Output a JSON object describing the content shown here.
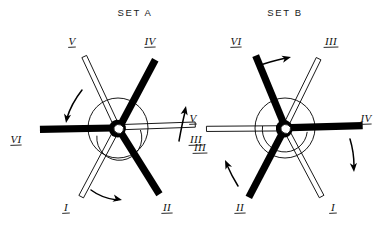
{
  "figure": {
    "caption": "",
    "sets": [
      {
        "id": "set-a",
        "title": "SET A",
        "title_x": 135,
        "title_y": 16,
        "center_x": 118,
        "center_y": 128,
        "hub_radius": 30,
        "spokes": [
          {
            "label": "V",
            "style": "hollow",
            "angle_deg": 115,
            "length": 78,
            "label_x": 72,
            "label_y": 45,
            "underline": true
          },
          {
            "label": "IV",
            "style": "solid",
            "angle_deg": 62,
            "length": 78,
            "label_x": 150,
            "label_y": 45,
            "underline": true
          },
          {
            "label": "III",
            "style": "hollow",
            "angle_deg": 2,
            "length": 78,
            "label_x": 200,
            "label_y": 151,
            "underline": true
          },
          {
            "label": "II",
            "style": "solid",
            "angle_deg": -58,
            "length": 78,
            "label_x": 167,
            "label_y": 211,
            "underline": true
          },
          {
            "label": "I",
            "style": "hollow",
            "angle_deg": -118,
            "length": 78,
            "label_x": 66,
            "label_y": 211,
            "underline": true
          },
          {
            "label": "VI",
            "style": "solid",
            "angle_deg": 181,
            "length": 78,
            "label_x": 16,
            "label_y": 143,
            "underline": true
          }
        ],
        "arrows": [
          {
            "name": "arrow-v-ccw",
            "d": "M 82 90 C 75 99 70 108 67 118",
            "tip_x": 66,
            "tip_y": 123,
            "tip_rot": 100,
            "label": ""
          },
          {
            "name": "arrow-v-up",
            "d": "M 179 141 C 181 130 183 120 185 112",
            "tip_x": 186,
            "tip_y": 106,
            "tip_rot": -78,
            "label": "V"
          },
          {
            "name": "arrow-i-cw",
            "d": "M 91 190 C 99 196 108 199 117 200",
            "tip_x": 122,
            "tip_y": 200,
            "tip_rot": 12,
            "label": ""
          }
        ],
        "arrow_labels": [
          {
            "text": "V",
            "x": 193,
            "y": 122,
            "underline": true
          }
        ]
      },
      {
        "id": "set-b",
        "title": "SET B",
        "title_x": 285,
        "title_y": 16,
        "center_x": 285,
        "center_y": 128,
        "hub_radius": 30,
        "spokes": [
          {
            "label": "VI",
            "style": "solid",
            "angle_deg": 112,
            "length": 78,
            "label_x": 236,
            "label_y": 45,
            "underline": true
          },
          {
            "label": "III",
            "style": "hollow",
            "angle_deg": 64,
            "length": 78,
            "label_x": 331,
            "label_y": 45,
            "underline": true
          },
          {
            "label": "IV",
            "style": "solid",
            "angle_deg": 2,
            "length": 78,
            "label_x": 366,
            "label_y": 122,
            "underline": true
          },
          {
            "label": "I",
            "style": "hollow",
            "angle_deg": -62,
            "length": 78,
            "label_x": 333,
            "label_y": 211,
            "underline": true
          },
          {
            "label": "II",
            "style": "solid",
            "angle_deg": -117,
            "length": 78,
            "label_x": 240,
            "label_y": 211,
            "underline": true
          },
          {
            "label": "III",
            "style": "hollow",
            "angle_deg": 181,
            "length": 78,
            "label_x": 196,
            "label_y": 143,
            "underline": true
          }
        ],
        "arrows": [
          {
            "name": "arrow-vi-cw",
            "d": "M 258 66 C 268 62 277 60 286 58",
            "tip_x": 291,
            "tip_y": 57,
            "tip_rot": -14,
            "label": ""
          },
          {
            "name": "arrow-iv-cw",
            "d": "M 350 139 C 353 149 354 158 354 166",
            "tip_x": 354,
            "tip_y": 172,
            "tip_rot": 86,
            "label": ""
          },
          {
            "name": "arrow-ii-ccw",
            "d": "M 238 186 C 233 178 230 172 227 165",
            "tip_x": 225,
            "tip_y": 160,
            "tip_rot": -115,
            "label": ""
          }
        ],
        "arrow_labels": []
      }
    ]
  }
}
